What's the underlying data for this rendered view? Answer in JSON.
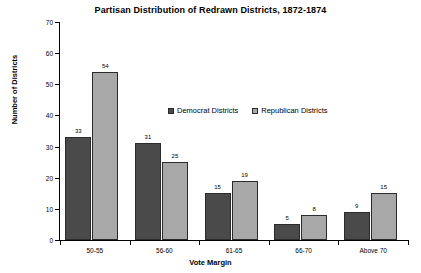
{
  "chart_data": {
    "type": "bar",
    "title": "Partisan Distribution of Redrawn Districts, 1872-1874",
    "xlabel": "Vote Margin",
    "ylabel": "Number of Districts",
    "ylim": [
      0,
      70
    ],
    "yticks": [
      0,
      10,
      20,
      30,
      40,
      50,
      60,
      70
    ],
    "grid": false,
    "legend_position": "inside-upper-center",
    "categories": [
      "50-55",
      "56-60",
      "61-65",
      "66-70",
      "Above 70"
    ],
    "series": [
      {
        "name": "Democrat Districts",
        "color": "#4a4a4a",
        "values": [
          33,
          31,
          15,
          5,
          9
        ]
      },
      {
        "name": "Republican Districts",
        "color": "#a8a8a8",
        "values": [
          54,
          25,
          19,
          8,
          15
        ]
      }
    ]
  },
  "colors": {
    "democrat": "#4a4a4a",
    "republican": "#a8a8a8",
    "axis": "#000000",
    "background": "#ffffff",
    "bar_border": "#2b2b2b"
  }
}
